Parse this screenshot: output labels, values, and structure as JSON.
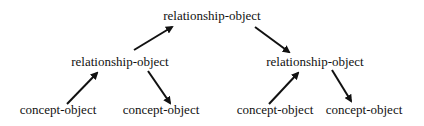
{
  "diagram": {
    "type": "tree",
    "nodes": [
      {
        "id": "root",
        "label": "relationship-object"
      },
      {
        "id": "left",
        "label": "relationship-object"
      },
      {
        "id": "right",
        "label": "relationship-object"
      },
      {
        "id": "left-a",
        "label": "concept-object"
      },
      {
        "id": "left-b",
        "label": "concept-object"
      },
      {
        "id": "right-a",
        "label": "concept-object"
      },
      {
        "id": "right-b",
        "label": "concept-object"
      }
    ],
    "edges": [
      {
        "from": "left",
        "to": "root"
      },
      {
        "from": "root",
        "to": "right"
      },
      {
        "from": "left-a",
        "to": "left"
      },
      {
        "from": "left",
        "to": "left-b"
      },
      {
        "from": "right-a",
        "to": "right"
      },
      {
        "from": "right",
        "to": "right-b"
      }
    ]
  },
  "colors": {
    "text": "#111111",
    "arrow": "#111111",
    "background": "#ffffff"
  }
}
